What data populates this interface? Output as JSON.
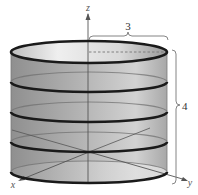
{
  "figure": {
    "axes": {
      "x_label": "x",
      "y_label": "y",
      "z_label": "z"
    },
    "dimensions": {
      "radius_label": "3",
      "height_label": "4"
    },
    "rings_count": 5,
    "colors": {
      "surface_dark": "#8a8a8a",
      "surface_light": "#e6e6e6",
      "ring": "#1a1a1a",
      "axis": "#555555",
      "bracket": "#777777"
    }
  }
}
